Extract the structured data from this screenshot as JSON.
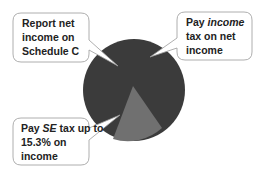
{
  "diagram": {
    "pie": {
      "center": [
        134,
        90
      ],
      "radius": 51,
      "main_color": "#3b3b3b",
      "wedge_color": "#6f6f6f",
      "wedge_points": [
        [
          133,
          86
        ],
        [
          113,
          139
        ],
        [
          162,
          128
        ]
      ]
    },
    "callouts": [
      {
        "id": "report",
        "lines": [
          "Report net",
          "income on",
          "Schedule C"
        ]
      },
      {
        "id": "income-tax",
        "line1_prefix": "Pay ",
        "line1_emphasis": "income",
        "lines_rest": [
          "tax on net",
          "income"
        ]
      },
      {
        "id": "se-tax",
        "line1_prefix": "Pay ",
        "line1_emphasis": "SE",
        "line1_suffix": " tax up to",
        "lines_rest": [
          "15.3% on",
          "income"
        ]
      }
    ]
  }
}
